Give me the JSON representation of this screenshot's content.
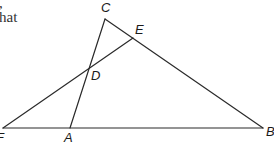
{
  "text_fragments": {
    "line1": ",",
    "line2": "hat"
  },
  "diagram": {
    "type": "geometry-figure",
    "points": {
      "A": {
        "label": "A",
        "x": 70,
        "y": 128
      },
      "B": {
        "label": "B",
        "x": 263,
        "y": 128
      },
      "C": {
        "label": "C",
        "x": 105,
        "y": 19
      },
      "D": {
        "label": "D",
        "x": 88,
        "y": 69
      },
      "E": {
        "label": "E",
        "x": 133,
        "y": 38
      },
      "F": {
        "label": "F",
        "x": 3,
        "y": 128
      }
    },
    "segments": [
      [
        "F",
        "B"
      ],
      [
        "C",
        "B"
      ],
      [
        "C",
        "A"
      ],
      [
        "F",
        "E"
      ]
    ],
    "line_color": "#2a2a2a"
  }
}
